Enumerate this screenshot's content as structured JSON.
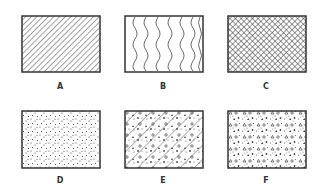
{
  "figure": {
    "panels": [
      {
        "label": "A",
        "pattern": "diagonal-hatch"
      },
      {
        "label": "B",
        "pattern": "wavy-lines"
      },
      {
        "label": "C",
        "pattern": "crosshatch"
      },
      {
        "label": "D",
        "pattern": "stipple-dots"
      },
      {
        "label": "E",
        "pattern": "diagonal-hatch-with-aggregate"
      },
      {
        "label": "F",
        "pattern": "aggregate-dots-triangles"
      }
    ]
  },
  "colors": {
    "ink": "#333333",
    "background": "#ffffff"
  }
}
